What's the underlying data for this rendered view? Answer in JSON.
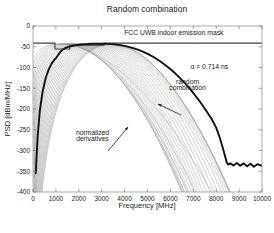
{
  "chart_data": {
    "type": "line",
    "title": "Random combination",
    "xlabel": "Frequency [MHz]",
    "ylabel": "PSD [dBm/MHz]",
    "xlim": [
      0,
      10000
    ],
    "ylim": [
      -400,
      0
    ],
    "xticks": [
      0,
      1000,
      2000,
      3000,
      4000,
      5000,
      6000,
      7000,
      8000,
      9000,
      10000
    ],
    "xticklabels": [
      "0",
      "1000",
      "2000",
      "3000",
      "4000",
      "5000",
      "6000",
      "7000",
      "8000",
      "9000",
      "10000"
    ],
    "yticks": [
      0,
      -50,
      -100,
      -150,
      -200,
      -250,
      -300,
      -350,
      -400
    ],
    "yticklabels": [
      "0",
      "-50",
      "-100",
      "-150",
      "-200",
      "-250",
      "-300",
      "-350",
      "-400"
    ],
    "grid": false,
    "legend": "none",
    "annotations": [
      {
        "name": "fcc-mask-label",
        "text": "FCC UWB indoor emission mask",
        "x": 6150,
        "y": -22
      },
      {
        "name": "alpha-label",
        "text": "α = 0.714 ns",
        "x": 7700,
        "y": -103
      },
      {
        "name": "random-combination-label",
        "text": "random",
        "x": 6750,
        "y": -140
      },
      {
        "name": "random-combination-label-2",
        "text": "combination",
        "x": 6750,
        "y": -155
      },
      {
        "name": "normalized-derivatives-label",
        "text": "normalized",
        "x": 2600,
        "y": -262
      },
      {
        "name": "normalized-derivatives-label-2",
        "text": "derivatives",
        "x": 2600,
        "y": -277
      }
    ],
    "series": [
      {
        "name": "FCC UWB indoor emission mask",
        "color": "#404040",
        "width": 1.1,
        "style": "step",
        "points": [
          [
            0,
            -41.3
          ],
          [
            960,
            -41.3
          ],
          [
            960,
            -55.3
          ],
          [
            1610,
            -55.3
          ],
          [
            1610,
            -46.5
          ],
          [
            3100,
            -46.5
          ],
          [
            3100,
            -41.3
          ],
          [
            10000,
            -41.3
          ]
        ]
      },
      {
        "name": "random combination",
        "color": "#111111",
        "width": 1.9,
        "style": "envelope",
        "peak_psd": -42.5,
        "peak_freq_range": [
          2600,
          3400
        ],
        "points": [
          [
            120,
            -355
          ],
          [
            200,
            -268
          ],
          [
            300,
            -203
          ],
          [
            420,
            -158
          ],
          [
            560,
            -124
          ],
          [
            700,
            -103
          ],
          [
            820,
            -90
          ],
          [
            900,
            -84
          ],
          [
            960,
            -80
          ],
          [
            1020,
            -76
          ],
          [
            1100,
            -70
          ],
          [
            1180,
            -63
          ],
          [
            1250,
            -59
          ],
          [
            1320,
            -56
          ],
          [
            1400,
            -53.5
          ],
          [
            1500,
            -51
          ],
          [
            1620,
            -49
          ],
          [
            1750,
            -47.5
          ],
          [
            1900,
            -46
          ],
          [
            2100,
            -44.6
          ],
          [
            2300,
            -43.6
          ],
          [
            2550,
            -42.9
          ],
          [
            2800,
            -42.6
          ],
          [
            3050,
            -42.6
          ],
          [
            3300,
            -43.1
          ],
          [
            3550,
            -44.2
          ],
          [
            3800,
            -46
          ],
          [
            4050,
            -48.5
          ],
          [
            4300,
            -52
          ],
          [
            4550,
            -56.5
          ],
          [
            4800,
            -62
          ],
          [
            5050,
            -68.5
          ],
          [
            5300,
            -76
          ],
          [
            5550,
            -85
          ],
          [
            5800,
            -95
          ],
          [
            6050,
            -106
          ],
          [
            6300,
            -119
          ],
          [
            6550,
            -133
          ],
          [
            6800,
            -148
          ],
          [
            7050,
            -165
          ],
          [
            7300,
            -183
          ],
          [
            7550,
            -203
          ],
          [
            7800,
            -224
          ],
          [
            8000,
            -245
          ],
          [
            8150,
            -268
          ],
          [
            8280,
            -292
          ],
          [
            8380,
            -312
          ],
          [
            8450,
            -327
          ],
          [
            8520,
            -334
          ],
          [
            8620,
            -331
          ],
          [
            8750,
            -336
          ],
          [
            8900,
            -330
          ],
          [
            9050,
            -337
          ],
          [
            9200,
            -331
          ],
          [
            9350,
            -338
          ],
          [
            9500,
            -332
          ],
          [
            9650,
            -339
          ],
          [
            9800,
            -333
          ],
          [
            10000,
            -337
          ]
        ]
      },
      {
        "name": "normalized derivatives family",
        "color": "#8a8a8a",
        "width": 0.45,
        "count": 26,
        "description": "Family of normalized Gaussian-derivative PSD curves with progressively higher-order peaks sweeping from about 1100 MHz to 3400 MHz; each rises steeply from the lower-left, peaks near -43 dBm/MHz and falls off to below -400 dBm/MHz past its peak.",
        "peak_freqs": [
          1150,
          1240,
          1330,
          1420,
          1510,
          1600,
          1700,
          1800,
          1900,
          2000,
          2100,
          2200,
          2300,
          2400,
          2500,
          2610,
          2720,
          2830,
          2940,
          3050,
          3150,
          3240,
          3320,
          3380,
          3420,
          3450
        ],
        "peak_psd": -43.0
      }
    ]
  },
  "axes": {
    "box_color": "#999999",
    "tick_color": "#777777"
  }
}
